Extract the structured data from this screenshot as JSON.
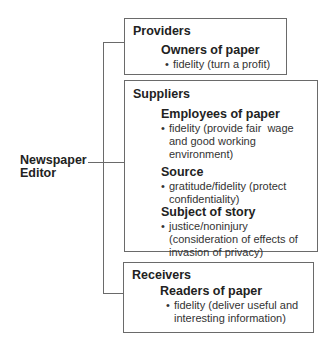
{
  "editor": {
    "line1": "Newspaper",
    "line2": "Editor"
  },
  "groups": [
    {
      "title": "Providers",
      "entries": [
        {
          "name": "Owners of paper",
          "bullets": [
            "fidelity (turn a profit)"
          ]
        }
      ]
    },
    {
      "title": "Suppliers",
      "entries": [
        {
          "name": "Employees of paper",
          "bullets": [
            "fidelity (provide fair  wage",
            "and good working",
            "environment)"
          ]
        },
        {
          "name": "Source",
          "bullets": [
            "gratitude/fidelity (protect",
            "confidentiality)"
          ]
        },
        {
          "name": "Subject of story",
          "bullets": [
            "justice/noninjury",
            "(consideration of effects of",
            "invasion of privacy)"
          ]
        }
      ]
    },
    {
      "title": "Receivers",
      "entries": [
        {
          "name": "Readers of paper",
          "bullets": [
            "fidelity (deliver useful and",
            "interesting information)"
          ]
        }
      ]
    }
  ],
  "bullet_char": "•"
}
